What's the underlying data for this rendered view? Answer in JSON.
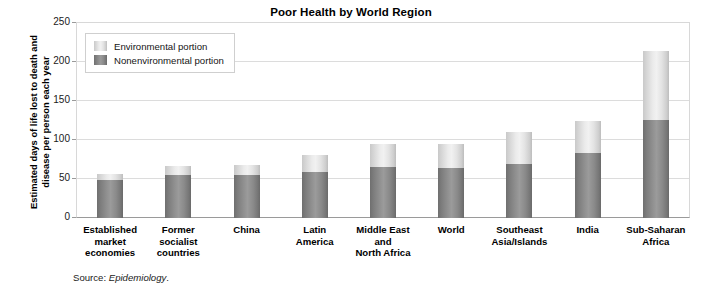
{
  "chart_data": {
    "type": "bar",
    "subtype": "stacked-vertical",
    "title": "Poor Health by World Region",
    "xlabel": "",
    "ylabel": "Estimated days of life lost to death and disease per person each year",
    "ylim": [
      0,
      250
    ],
    "yticks": [
      0,
      50,
      100,
      150,
      200,
      250
    ],
    "grid": true,
    "legend_position": "upper-left-inside",
    "categories": [
      "Established market economies",
      "Former socialist countries",
      "China",
      "Latin America",
      "Middle East and North Africa",
      "World",
      "Southeast Asia/Islands",
      "India",
      "Sub-Saharan Africa"
    ],
    "category_lines": [
      [
        "Established",
        "market",
        "economies"
      ],
      [
        "Former",
        "socialist",
        "countries"
      ],
      [
        "China"
      ],
      [
        "Latin",
        "America"
      ],
      [
        "Middle East",
        "and",
        "North Africa"
      ],
      [
        "World"
      ],
      [
        "Southeast",
        "Asia/Islands"
      ],
      [
        "India"
      ],
      [
        "Sub-Saharan",
        "Africa"
      ]
    ],
    "series": [
      {
        "name": "Nonenvironmental portion",
        "color": "#8a8a8a",
        "values": [
          48,
          55,
          55,
          59,
          65,
          64,
          69,
          83,
          125
        ]
      },
      {
        "name": "Environmental portion",
        "color": "#e3e3e3",
        "values": [
          8,
          11,
          13,
          22,
          30,
          31,
          41,
          41,
          88
        ]
      }
    ],
    "totals": [
      56,
      66,
      68,
      81,
      95,
      95,
      110,
      124,
      213
    ]
  },
  "legend": {
    "items": [
      {
        "label": "Environmental portion",
        "swatch": "light-gray-gradient-swatch"
      },
      {
        "label": "Nonenvironmental portion",
        "swatch": "dark-gray-gradient-swatch"
      }
    ]
  },
  "source": {
    "prefix": "Source: ",
    "publication": "Epidemiology",
    "suffix": "."
  }
}
